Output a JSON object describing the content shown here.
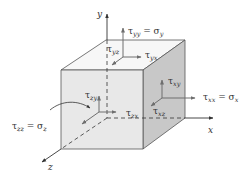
{
  "diagram": {
    "axes": {
      "x": "x",
      "y": "y",
      "z": "z"
    },
    "labels": {
      "tau_yy": {
        "sym": "τ",
        "sub": "yy",
        "eq": " = σ",
        "eqsub": "y"
      },
      "tau_yz": {
        "sym": "τ",
        "sub": "yz"
      },
      "tau_yx": {
        "sym": "τ",
        "sub": "yx"
      },
      "tau_xy": {
        "sym": "τ",
        "sub": "xy"
      },
      "tau_xx": {
        "sym": "τ",
        "sub": "xx",
        "eq": " = σ",
        "eqsub": "x"
      },
      "tau_xz": {
        "sym": "τ",
        "sub": "xz"
      },
      "tau_zy": {
        "sym": "τ",
        "sub": "zy"
      },
      "tau_zx": {
        "sym": "τ",
        "sub": "zx"
      },
      "tau_zz": {
        "sym": "τ",
        "sub": "zz",
        "eq": " = σ",
        "eqsub": "z"
      }
    },
    "colors": {
      "front_face": "#e8e8e8",
      "top_face": "#f7f7f7",
      "right_face": "#c8c8c8",
      "edge": "#555555",
      "arrow": "#6e6e6e",
      "axis": "#333333"
    }
  }
}
